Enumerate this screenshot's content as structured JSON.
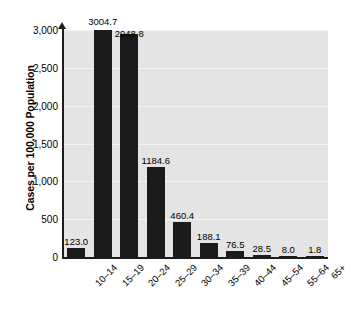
{
  "chart_data": {
    "type": "bar",
    "title": "",
    "xlabel": "",
    "ylabel": "Cases per 100,000 Population",
    "categories": [
      "10–14",
      "15–19",
      "20–24",
      "25–29",
      "30–34",
      "35–39",
      "40–44",
      "45–54",
      "55–64",
      "65+"
    ],
    "values": [
      123.0,
      3004.7,
      2948.8,
      1184.6,
      460.4,
      188.1,
      76.5,
      28.5,
      8.0,
      1.8
    ],
    "value_labels": [
      "123.0",
      "3004.7",
      "2948.8",
      "1184.6",
      "460.4",
      "188.1",
      "76.5",
      "28.5",
      "8.0",
      "1.8"
    ],
    "ylim": [
      0,
      3000
    ],
    "yticks": [
      0,
      500,
      1000,
      1500,
      2000,
      2500,
      3000
    ],
    "ytick_labels": [
      "0",
      "500",
      "1,000",
      "1,500",
      "2,000",
      "2,500",
      "3,000"
    ],
    "grid": true,
    "legend": "none",
    "bar_color": "#1b1b1b",
    "plot_background": "#e4e4e4",
    "gridline_color": "#f4f4f4",
    "axis_color": "#1d1d1d"
  }
}
